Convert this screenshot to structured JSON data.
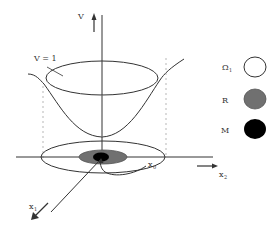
{
  "diagram": {
    "axes": {
      "vertical_label": "V",
      "x1_label": "x",
      "x1_sub": "1",
      "x2_label": "x",
      "x2_sub": "2"
    },
    "annotations": {
      "level_set_label": "V = 1",
      "trajectory_start_label": "x",
      "trajectory_start_sub": "0"
    },
    "legend": {
      "items": [
        {
          "label": "Ω",
          "sub": "1",
          "fill": "#ffffff",
          "stroke": "#333333",
          "name": "omega1"
        },
        {
          "label": "R",
          "sub": "",
          "fill": "#707070",
          "stroke": "#555555",
          "name": "r"
        },
        {
          "label": "M",
          "sub": "",
          "fill": "#000000",
          "stroke": "#000000",
          "name": "m"
        }
      ]
    },
    "colors": {
      "line": "#333333",
      "dashed": "#999999",
      "region_r": "#707070",
      "region_m": "#000000"
    }
  }
}
